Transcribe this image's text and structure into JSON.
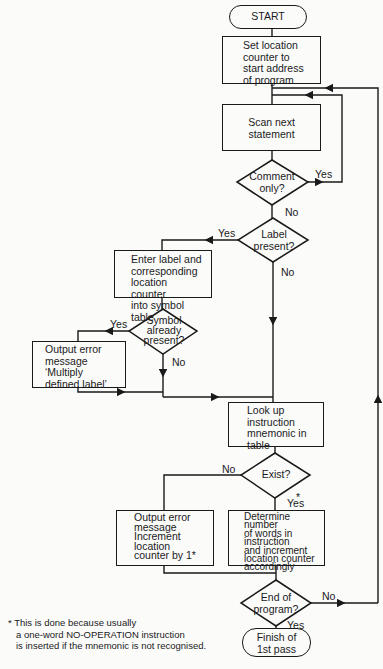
{
  "flowchart": {
    "start": "START",
    "set_location": [
      "Set location",
      "counter to",
      "start address",
      "of program"
    ],
    "scan": [
      "Scan next",
      "statement"
    ],
    "comment_only": [
      "Comment",
      "only?"
    ],
    "label_present": [
      "Label",
      "present?"
    ],
    "enter_label": [
      "Enter label and",
      "corresponding",
      "location counter",
      "into symbol table"
    ],
    "symbol_present": [
      "Symbol",
      "already",
      "present?"
    ],
    "output_error_multiply": [
      "Output error",
      "message",
      "‘Multiply",
      "defined label’"
    ],
    "look_up": [
      "Look up",
      "instruction",
      "mnemonic in",
      "table"
    ],
    "exist": "Exist?",
    "output_error_increment": [
      "Output error",
      "message",
      "Increment",
      "location",
      "counter by 1*"
    ],
    "determine": [
      "Determine number",
      "of words in",
      "instruction",
      "and increment",
      "location counter",
      "accordingly"
    ],
    "end_of_program": [
      "End of",
      "program?"
    ],
    "finish": [
      "Finish of",
      "1st pass"
    ],
    "labels": {
      "yes": "Yes",
      "no": "No",
      "asterisk": "*"
    },
    "footnote": [
      "* This is done because usually",
      "a one-word NO-OPERATION instruction",
      "is inserted if the mnemonic is not recognised."
    ]
  }
}
